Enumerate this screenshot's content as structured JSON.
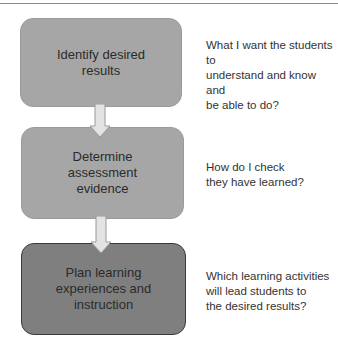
{
  "diagram": {
    "type": "backward-design-flowchart",
    "colors": {
      "stage_fill_light": "#a6a6a6",
      "stage_fill_dark": "#7f7f7f",
      "arrow_fill": "#e3e3e3",
      "arrow_stroke": "#9a9a9a",
      "text": "#2b2b2b"
    },
    "stages": [
      {
        "label": "Identify desired\nresults",
        "question": "What I want the students to\nunderstand and know and\nbe able to do?"
      },
      {
        "label": "Determine\nassessment\nevidence",
        "question": "How do I check\nthey have learned?"
      },
      {
        "label": "Plan learning\nexperiences and\ninstruction",
        "question": "Which learning activities\nwill lead students to\nthe desired results?"
      }
    ],
    "connectors": [
      {
        "from": 0,
        "to": 1,
        "icon": "arrow-down-icon"
      },
      {
        "from": 1,
        "to": 2,
        "icon": "arrow-down-icon"
      }
    ]
  }
}
